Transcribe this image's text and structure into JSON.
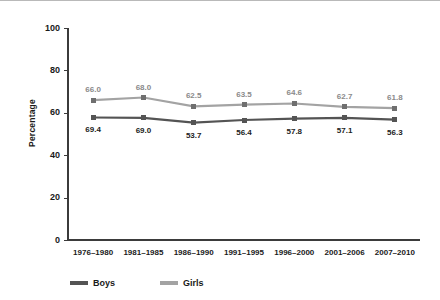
{
  "chart_data": {
    "type": "line",
    "title": "",
    "xlabel": "",
    "ylabel": "Percentage",
    "ylim": [
      0,
      100
    ],
    "yticks": [
      0,
      20,
      40,
      60,
      80,
      100
    ],
    "grid": false,
    "legend_position": "bottom",
    "categories": [
      "1976–1980",
      "1981–1985",
      "1986–1990",
      "1991–1995",
      "1996–2000",
      "2001–2006",
      "2007–2010"
    ],
    "series": [
      {
        "name": "Boys",
        "color": "#545454",
        "label_color": "#222222",
        "label_position": "below",
        "values": [
          69.4,
          69.0,
          53.7,
          56.4,
          57.8,
          57.1,
          56.3
        ],
        "plotted": [
          57.8,
          57.6,
          55.4,
          56.6,
          57.2,
          57.6,
          56.8
        ],
        "labels": [
          "69.4",
          "69.0",
          "53.7",
          "56.4",
          "57.8",
          "57.1",
          "56.3"
        ]
      },
      {
        "name": "Girls",
        "color": "#a3a3a3",
        "label_color": "#8a8a8a",
        "label_position": "above",
        "values": [
          66.0,
          68.0,
          62.5,
          63.5,
          64.6,
          62.7,
          61.8
        ],
        "plotted": [
          66.0,
          67.2,
          63.0,
          63.8,
          64.4,
          62.8,
          62.2
        ],
        "labels": [
          "66.0",
          "68.0",
          "62.5",
          "63.5",
          "64.6",
          "62.7",
          "61.8"
        ]
      }
    ]
  },
  "legend": {
    "items": [
      {
        "label": "Boys",
        "color": "#545454"
      },
      {
        "label": "Girls",
        "color": "#a3a3a3"
      }
    ]
  }
}
